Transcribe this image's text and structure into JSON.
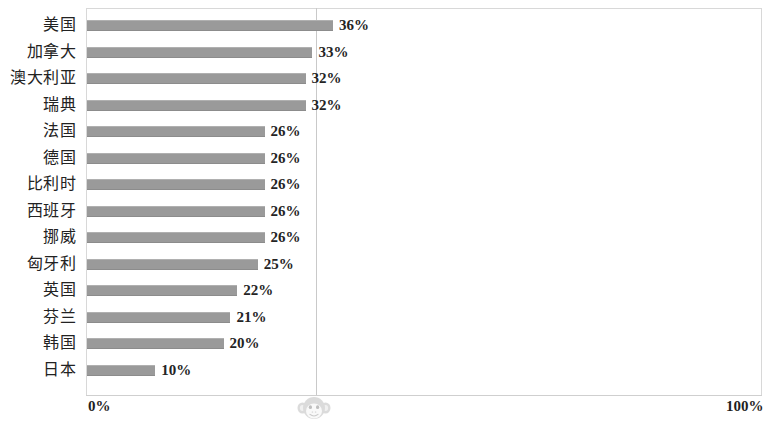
{
  "chart_data": {
    "type": "bar",
    "orientation": "horizontal",
    "title": "",
    "subtitle": "",
    "xlabel": "",
    "ylabel": "",
    "xlim": [
      0,
      100
    ],
    "x_tick_labels": [
      "0%",
      "100%"
    ],
    "grid": true,
    "gridlines_x": [
      33.5
    ],
    "legend": null,
    "value_suffix": "%",
    "bar_color": "#9a9a9a",
    "plot_border_color": "#d8d8d8",
    "categories": [
      "美国",
      "加拿大",
      "澳大利亚",
      "瑞典",
      "法国",
      "德国",
      "比利时",
      "西班牙",
      "挪威",
      "匈牙利",
      "英国",
      "芬兰",
      "韩国",
      "日本"
    ],
    "values": [
      36,
      33,
      32,
      32,
      26,
      26,
      26,
      26,
      26,
      25,
      22,
      21,
      20,
      10
    ],
    "data_labels": [
      "36%",
      "33%",
      "32%",
      "32%",
      "26%",
      "26%",
      "26%",
      "26%",
      "26%",
      "25%",
      "22%",
      "21%",
      "20%",
      "10%"
    ],
    "rows": [
      {
        "label": "美国",
        "value": 36,
        "data_label": "36%"
      },
      {
        "label": "加拿大",
        "value": 33,
        "data_label": "33%"
      },
      {
        "label": "澳大利亚",
        "value": 32,
        "data_label": "32%"
      },
      {
        "label": "瑞典",
        "value": 32,
        "data_label": "32%"
      },
      {
        "label": "法国",
        "value": 26,
        "data_label": "26%"
      },
      {
        "label": "德国",
        "value": 26,
        "data_label": "26%"
      },
      {
        "label": "比利时",
        "value": 26,
        "data_label": "26%"
      },
      {
        "label": "西班牙",
        "value": 26,
        "data_label": "26%"
      },
      {
        "label": "挪威",
        "value": 26,
        "data_label": "26%"
      },
      {
        "label": "匈牙利",
        "value": 25,
        "data_label": "25%"
      },
      {
        "label": "英国",
        "value": 22,
        "data_label": "22%"
      },
      {
        "label": "芬兰",
        "value": 21,
        "data_label": "21%"
      },
      {
        "label": "韩国",
        "value": 20,
        "data_label": "20%"
      },
      {
        "label": "日本",
        "value": 10,
        "data_label": "10%"
      }
    ]
  },
  "axis": {
    "min_label": "0%",
    "max_label": "100%"
  },
  "watermark": {
    "icon": "monkey-face-icon"
  }
}
